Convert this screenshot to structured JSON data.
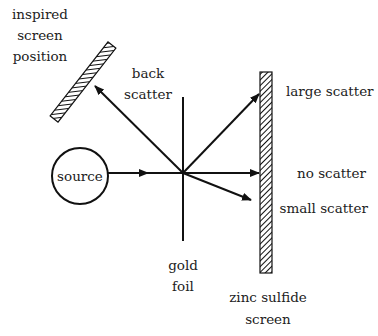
{
  "diagram": {
    "labels": {
      "inspired_screen": [
        "inspired",
        "screen",
        "position"
      ],
      "back_scatter": [
        "back",
        "scatter"
      ],
      "large_scatter": "large scatter",
      "no_scatter": "no scatter",
      "small_scatter": "small scatter",
      "source": "source",
      "gold_foil": [
        "gold",
        "foil"
      ],
      "zinc_sulfide_screen": [
        "zinc sulfide",
        "screen"
      ]
    },
    "colors": {
      "stroke": "#111111",
      "text": "#222222",
      "background": "#ffffff"
    }
  }
}
